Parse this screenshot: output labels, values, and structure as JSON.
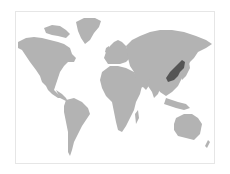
{
  "map": {
    "type": "world-choropleth",
    "projection": "equirectangular-like",
    "colors": {
      "background": "#ffffff",
      "frame_border": "#e6e6e6",
      "land": "#b3b3b3",
      "highlight": "#555555"
    },
    "highlighted_regions": [
      {
        "name": "Northeast China (Manchuria)",
        "color": "#555555"
      }
    ],
    "labels": []
  }
}
